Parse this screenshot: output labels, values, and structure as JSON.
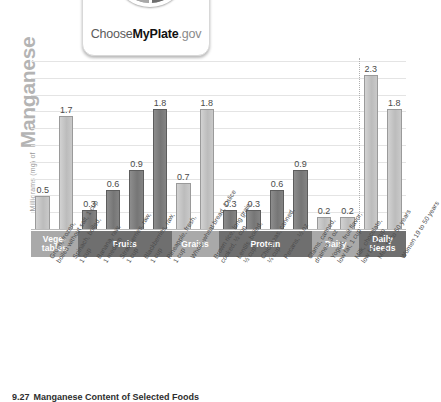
{
  "figure": {
    "caption_number": "9.27",
    "caption_text": "Manganese Content of Selected Foods",
    "y_axis_small": "Milligrams (mg) of",
    "y_axis_big": "Manganese"
  },
  "logo": {
    "name": "choose-myplate-logo",
    "word_choose": "Choose",
    "word_myplate": "MyPlate",
    "word_gov": ".gov"
  },
  "categories": [
    {
      "label": "Vege-\ntables",
      "line1": "Vege-",
      "line2": "tables",
      "tone": "light",
      "bars": 2
    },
    {
      "label": "Fruits",
      "line1": "Fruits",
      "line2": "",
      "tone": "dark",
      "bars": 4
    },
    {
      "label": "Grains",
      "line1": "Grains",
      "line2": "",
      "tone": "light",
      "bars": 2
    },
    {
      "label": "Protein",
      "line1": "Protein",
      "line2": "",
      "tone": "dark",
      "bars": 4
    },
    {
      "label": "Dairy",
      "line1": "Dairy",
      "line2": "",
      "tone": "light",
      "bars": 2
    },
    {
      "label": "Daily\nNeeds",
      "line1": "Daily",
      "line2": "Needs",
      "tone": "dark",
      "bars": 2
    }
  ],
  "chart_data": {
    "type": "bar",
    "title": "Manganese Content of Selected Foods",
    "xlabel": "",
    "ylabel": "Milligrams (mg) of Manganese",
    "ylim": [
      0,
      2.5
    ],
    "grid": true,
    "gridlines": [
      0.25,
      0.5,
      0.75,
      1.0,
      1.25,
      1.5,
      1.75,
      2.0,
      2.25,
      2.5
    ],
    "legend": "none",
    "annotations": [
      "Dotted vertical divider separates food items from Daily Needs reference bars"
    ],
    "categories": [
      "Green, frozen, boiled without salt, 1 cup",
      "Spinach, boiled, 1 cup",
      "Banana, raw, 1 medium",
      "Strawberries, raw, 1 cup",
      "Blackberries, raw, 1 cup",
      "Pineapple, fresh, 1 cup",
      "Whole-wheat bread, 1 slice",
      "Brown rice, long grain, cooked, ½ cup",
      "Lentils, boiled, ½ cup",
      "Chickpeas, canned, ¼ cup",
      "Pecans, ½ oz",
      "Clams, canned, drained, 3 oz",
      "Yogurt, fruit flavor, low fat, 1 cup",
      "Milk, chocolate, low fat, 1 cup",
      "Men 19 to 50 years",
      "Women 19 to 50 years"
    ],
    "values": [
      0.5,
      1.7,
      0.3,
      0.6,
      0.9,
      1.8,
      0.7,
      1.8,
      0.3,
      0.3,
      0.6,
      0.9,
      0.2,
      0.2,
      2.3,
      1.8
    ],
    "value_labels": [
      "0.5",
      "1.7",
      "0.3",
      "0.6",
      "0.9",
      "1.8",
      "0.7",
      "1.8",
      "0.3",
      "0.3",
      "0.6",
      "0.9",
      "0.2",
      "0.2",
      "2.3",
      "1.8"
    ],
    "bar_tones": [
      "light",
      "light",
      "dark",
      "dark",
      "dark",
      "dark",
      "light",
      "light",
      "dark",
      "dark",
      "dark",
      "dark",
      "light",
      "light",
      "light",
      "light"
    ],
    "group_of": [
      "Vegetables",
      "Vegetables",
      "Fruits",
      "Fruits",
      "Fruits",
      "Fruits",
      "Grains",
      "Grains",
      "Protein",
      "Protein",
      "Protein",
      "Protein",
      "Dairy",
      "Dairy",
      "Daily Needs",
      "Daily Needs"
    ]
  },
  "colors": {
    "bar_light": "#c7c7c7",
    "bar_dark": "#7d7d7d",
    "band_light": "#a9a9a9",
    "band_dark": "#6f6f6f",
    "gridline": "#e4e4e4",
    "axis": "#bbbbbb",
    "value_text": "#4a4a4a",
    "y_title": "#b4b4b4"
  }
}
